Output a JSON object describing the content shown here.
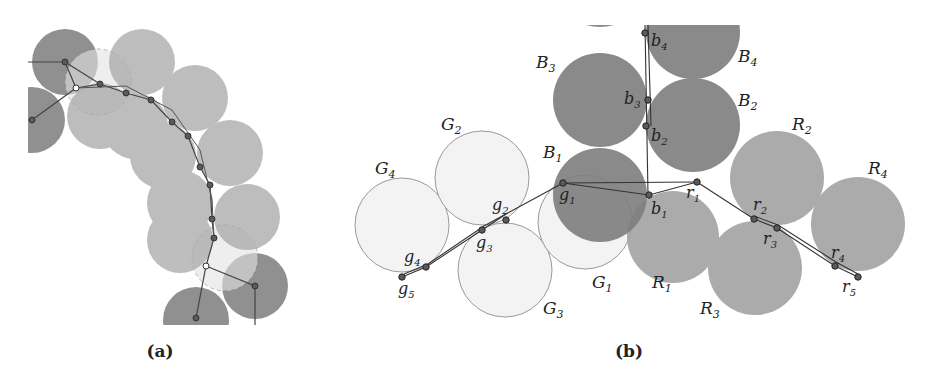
{
  "figure": {
    "panels": [
      {
        "id": "a",
        "caption": "(a)",
        "description": "Chain of overlapping gray disks along a curved path with node points"
      },
      {
        "id": "b",
        "caption": "(b)",
        "description": "Three branches of disks (B, G, R) meeting at junction points",
        "circle_labels": {
          "B1": {
            "base": "B",
            "sub": "1"
          },
          "B2": {
            "base": "B",
            "sub": "2"
          },
          "B3": {
            "base": "B",
            "sub": "3"
          },
          "B4": {
            "base": "B",
            "sub": "4"
          },
          "G1": {
            "base": "G",
            "sub": "1"
          },
          "G2": {
            "base": "G",
            "sub": "2"
          },
          "G3": {
            "base": "G",
            "sub": "3"
          },
          "G4": {
            "base": "G",
            "sub": "4"
          },
          "R1": {
            "base": "R",
            "sub": "1"
          },
          "R2": {
            "base": "R",
            "sub": "2"
          },
          "R3": {
            "base": "R",
            "sub": "3"
          },
          "R4": {
            "base": "R",
            "sub": "4"
          }
        },
        "point_labels": {
          "b1": {
            "base": "b",
            "sub": "1"
          },
          "b2": {
            "base": "b",
            "sub": "2"
          },
          "b3": {
            "base": "b",
            "sub": "3"
          },
          "b4": {
            "base": "b",
            "sub": "4"
          },
          "g1": {
            "base": "g",
            "sub": "1"
          },
          "g2": {
            "base": "g",
            "sub": "2"
          },
          "g3": {
            "base": "g",
            "sub": "3"
          },
          "g4": {
            "base": "g",
            "sub": "4"
          },
          "g5": {
            "base": "g",
            "sub": "5"
          },
          "r1": {
            "base": "r",
            "sub": "1"
          },
          "r2": {
            "base": "r",
            "sub": "2"
          },
          "r3": {
            "base": "r",
            "sub": "3"
          },
          "r4": {
            "base": "r",
            "sub": "4"
          },
          "r5": {
            "base": "r",
            "sub": "5"
          }
        }
      }
    ],
    "colors": {
      "dark_disk": "#7a7a7a",
      "mid_disk": "#a0a0a0",
      "light_disk": "#f2f2f2",
      "outline": "#8a8a8a",
      "node": "#555555",
      "line": "#333333"
    }
  }
}
